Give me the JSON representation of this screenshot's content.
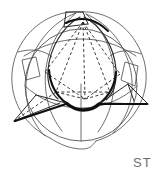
{
  "figure": {
    "label": "ST",
    "title": "",
    "kind": "stereographic-projection-diagram",
    "colors": {
      "background": "#ffffff",
      "thin_line": "#4a4a4a",
      "medium_line": "#2b2b2b",
      "heavy_line": "#101010",
      "dashed_line": "#1a1a1a",
      "label_text": "#6e6e6e"
    },
    "stroke_widths": {
      "thin": 0.8,
      "medium": 1.1,
      "heavy": 2.6,
      "dashed": 0.85
    },
    "dash_pattern": "3 2.4",
    "elements": [
      {
        "name": "outer-envelope",
        "style": "thin-solid"
      },
      {
        "name": "sphere-outline",
        "style": "thin-solid"
      },
      {
        "name": "great-circle-left",
        "style": "thin-solid"
      },
      {
        "name": "great-circle-right",
        "style": "thin-solid"
      },
      {
        "name": "equator-ellipse",
        "style": "thin-solid"
      },
      {
        "name": "meridian-vertical",
        "style": "thin-solid"
      },
      {
        "name": "inscribed-tetrahedron",
        "style": "dashed"
      },
      {
        "name": "heavy-seam-curve",
        "style": "heavy-solid"
      },
      {
        "name": "left-cusp-wedge",
        "style": "medium-solid"
      },
      {
        "name": "right-cusp-wedge",
        "style": "medium-solid"
      },
      {
        "name": "top-cusp-wedge",
        "style": "medium-solid"
      }
    ]
  }
}
